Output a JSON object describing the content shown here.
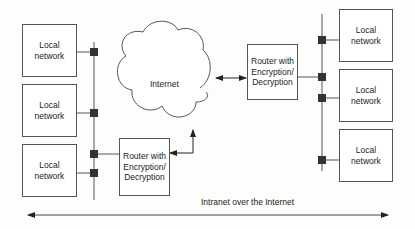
{
  "diagram": {
    "title": "Intranet over the Internet",
    "cloud_label": "Internet",
    "left_networks": [
      {
        "label_line1": "Local",
        "label_line2": "network"
      },
      {
        "label_line1": "Local",
        "label_line2": "network"
      },
      {
        "label_line1": "Local",
        "label_line2": "network"
      }
    ],
    "right_networks": [
      {
        "label_line1": "Local",
        "label_line2": "network"
      },
      {
        "label_line1": "Local",
        "label_line2": "network"
      },
      {
        "label_line1": "Local",
        "label_line2": "network"
      }
    ],
    "router_left": {
      "line1": "Router with",
      "line2": "Encryption/",
      "line3": "Decryption"
    },
    "router_right": {
      "line1": "Router with",
      "line2": "Encryption/",
      "line3": "Decryption"
    },
    "colors": {
      "line": "#555555",
      "connector": "#333333",
      "background": "#fdfdfb"
    }
  }
}
